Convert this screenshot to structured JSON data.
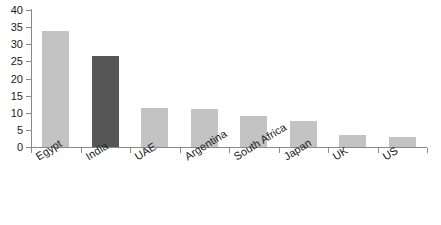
{
  "chart_data": {
    "type": "bar",
    "title": "",
    "subtitle": "",
    "xlabel": "",
    "ylabel": "",
    "categories": [
      "Egypt",
      "India",
      "UAE",
      "Argentina",
      "South Africa",
      "Japan",
      "UK",
      "US"
    ],
    "values": [
      34.0,
      26.5,
      11.5,
      11.0,
      9.0,
      7.5,
      3.5,
      3.0
    ],
    "series": [
      {
        "name": "",
        "values": [
          34.0,
          26.5,
          11.5,
          11.0,
          9.0,
          7.5,
          3.5,
          3.0
        ]
      }
    ],
    "bar_colors": [
      "#c3c3c3",
      "#565656",
      "#c3c3c3",
      "#c3c3c3",
      "#c3c3c3",
      "#c3c3c3",
      "#c3c3c3",
      "#c3c3c3"
    ],
    "highlighted_category": "India",
    "ylim": [
      0,
      40
    ],
    "ytick_values": [
      0,
      5,
      10,
      15,
      20,
      25,
      30,
      35,
      40
    ],
    "ytick_labels": [
      "0",
      "5",
      "10",
      "15",
      "20",
      "25",
      "30",
      "35",
      "40"
    ],
    "grid": false,
    "legend": null,
    "legend_position": "none",
    "annotations": [],
    "axis_color": "#8a8a8a",
    "label_rotation_deg": -32,
    "background": "#ffffff"
  }
}
